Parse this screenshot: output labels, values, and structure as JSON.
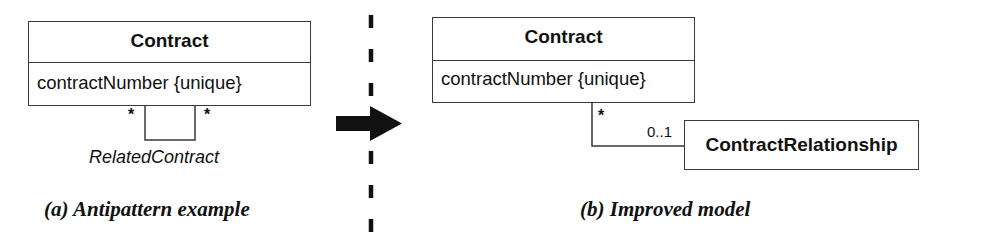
{
  "panel_a": {
    "class": {
      "name": "Contract",
      "attribute": "contractNumber {unique}"
    },
    "self_association": {
      "name": "RelatedContract",
      "multiplicity_left": "*",
      "multiplicity_right": "*"
    },
    "caption": "(a) Antipattern example"
  },
  "separator": {
    "style": "dashed",
    "arrow": "right-arrow"
  },
  "panel_b": {
    "class": {
      "name": "Contract",
      "attribute": "contractNumber {unique}"
    },
    "related_class": {
      "name": "ContractRelationship"
    },
    "association": {
      "multiplicity_contract_end": "*",
      "multiplicity_relationship_end": "0..1"
    },
    "caption": "(b) Improved model"
  },
  "colors": {
    "line": "#3a3a3a",
    "text": "#111111",
    "background": "#ffffff"
  }
}
